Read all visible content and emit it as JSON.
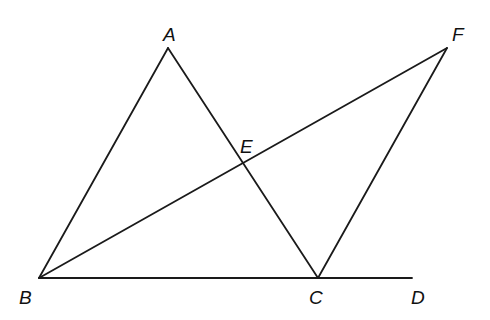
{
  "diagram": {
    "type": "geometry",
    "points": {
      "A": {
        "label": "A",
        "x": 168,
        "y": 48,
        "label_x": 163,
        "label_y": 41
      },
      "B": {
        "label": "B",
        "x": 39,
        "y": 278,
        "label_x": 19,
        "label_y": 304
      },
      "C": {
        "label": "C",
        "x": 318,
        "y": 278,
        "label_x": 309,
        "label_y": 304
      },
      "D": {
        "label": "D",
        "x": 412,
        "y": 278,
        "label_x": 411,
        "label_y": 304
      },
      "E": {
        "label": "E",
        "x": 242,
        "y": 163,
        "label_x": 240,
        "label_y": 153
      },
      "F": {
        "label": "F",
        "x": 447,
        "y": 48,
        "label_x": 452,
        "label_y": 41
      }
    },
    "segments": [
      {
        "name": "AB",
        "from": "A",
        "to": "B"
      },
      {
        "name": "AC",
        "from": "A",
        "to": "C"
      },
      {
        "name": "BD",
        "from": "B",
        "to": "D"
      },
      {
        "name": "BF",
        "from": "B",
        "to": "F"
      },
      {
        "name": "CF",
        "from": "C",
        "to": "F"
      }
    ],
    "stroke_color": "#1a1a1a",
    "background": "#ffffff"
  }
}
